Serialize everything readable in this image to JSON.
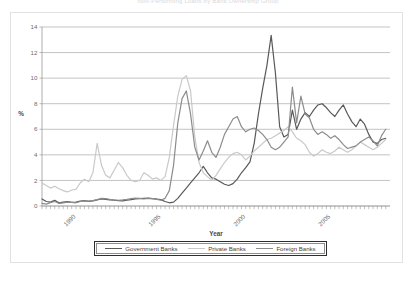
{
  "title": "Non-Performing Loans by Bank Ownership Group",
  "axis": {
    "ylabel": "%",
    "xlabel": "Year"
  },
  "legend": {
    "items": [
      {
        "label": "Government Banks",
        "color": "#595959"
      },
      {
        "label": "Private Banks",
        "color": "#c9c9c9"
      },
      {
        "label": "Foreign Banks",
        "color": "#8c8c8c"
      }
    ]
  },
  "chart_data": {
    "type": "line",
    "title": "Non-Performing Loans by Bank Ownership Group",
    "xlabel": "Year",
    "ylabel": "%",
    "xlim": [
      1988.0,
      2008.5
    ],
    "ylim": [
      0,
      14
    ],
    "yticks": [
      0,
      2,
      4,
      6,
      8,
      10,
      12,
      14
    ],
    "xticks": [
      1990,
      1995,
      2000,
      2005
    ],
    "xtick_labels": [
      "1990",
      "1995",
      "2000",
      "2005"
    ],
    "grid": "horizontal",
    "legend_position": "bottom",
    "x_tick_rotation": -45,
    "x": [
      1988.0,
      1988.25,
      1988.5,
      1988.75,
      1989.0,
      1989.25,
      1989.5,
      1989.75,
      1990.0,
      1990.25,
      1990.5,
      1990.75,
      1991.0,
      1991.25,
      1991.5,
      1991.75,
      1992.0,
      1992.25,
      1992.5,
      1992.75,
      1993.0,
      1993.25,
      1993.5,
      1993.75,
      1994.0,
      1994.25,
      1994.5,
      1994.75,
      1995.0,
      1995.25,
      1995.5,
      1995.75,
      1996.0,
      1996.25,
      1996.5,
      1996.75,
      1997.0,
      1997.25,
      1997.5,
      1997.75,
      1998.0,
      1998.25,
      1998.5,
      1998.75,
      1999.0,
      1999.25,
      1999.5,
      1999.75,
      2000.0,
      2000.25,
      2000.5,
      2000.75,
      2001.0,
      2001.25,
      2001.5,
      2001.75,
      2002.0,
      2002.25,
      2002.5,
      2002.75,
      2003.0,
      2003.25,
      2003.5,
      2003.75,
      2004.0,
      2004.25,
      2004.5,
      2004.75,
      2005.0,
      2005.25,
      2005.5,
      2005.75,
      2006.0,
      2006.25,
      2006.5,
      2006.75,
      2007.0,
      2007.25,
      2007.5,
      2007.75,
      2008.0,
      2008.25
    ],
    "series": [
      {
        "name": "Government Banks",
        "color": "#595959",
        "values": [
          0.55,
          0.35,
          0.3,
          0.45,
          0.25,
          0.3,
          0.35,
          0.28,
          0.3,
          0.38,
          0.42,
          0.36,
          0.4,
          0.48,
          0.55,
          0.52,
          0.48,
          0.45,
          0.42,
          0.4,
          0.45,
          0.5,
          0.55,
          0.58,
          0.6,
          0.62,
          0.58,
          0.55,
          0.5,
          0.35,
          0.25,
          0.3,
          0.6,
          1.0,
          1.4,
          1.8,
          2.2,
          2.6,
          3.1,
          2.6,
          2.2,
          2.1,
          1.9,
          1.7,
          1.6,
          1.75,
          2.1,
          2.6,
          3.0,
          3.45,
          4.9,
          7.2,
          9.2,
          11.0,
          13.35,
          10.4,
          6.2,
          5.4,
          5.6,
          7.5,
          6.0,
          6.8,
          7.3,
          7.0,
          7.5,
          7.9,
          8.0,
          7.7,
          7.3,
          7.0,
          7.5,
          7.9,
          7.2,
          6.6,
          6.2,
          6.8,
          6.4,
          5.6,
          5.0,
          4.9,
          5.2,
          5.3
        ]
      },
      {
        "name": "Private Banks",
        "color": "#c9c9c9",
        "values": [
          1.8,
          1.6,
          1.4,
          1.55,
          1.35,
          1.2,
          1.1,
          1.25,
          1.3,
          1.8,
          2.1,
          1.9,
          2.6,
          4.9,
          3.2,
          2.4,
          2.2,
          2.8,
          3.4,
          3.0,
          2.4,
          2.0,
          1.9,
          2.0,
          2.6,
          2.4,
          2.1,
          2.2,
          2.0,
          2.3,
          3.8,
          6.3,
          8.6,
          9.9,
          10.2,
          9.0,
          5.4,
          3.4,
          2.6,
          2.3,
          2.0,
          2.4,
          2.9,
          3.4,
          3.8,
          4.1,
          4.2,
          4.0,
          3.6,
          3.9,
          4.3,
          4.6,
          4.9,
          5.2,
          5.3,
          5.5,
          5.7,
          5.9,
          6.2,
          5.8,
          5.3,
          5.1,
          4.8,
          4.2,
          3.9,
          4.1,
          4.4,
          4.2,
          4.1,
          4.3,
          4.6,
          4.4,
          4.2,
          4.4,
          4.7,
          5.0,
          4.8,
          4.6,
          4.4,
          4.6,
          4.9,
          5.2
        ]
      },
      {
        "name": "Foreign Banks",
        "color": "#8c8c8c",
        "values": [
          0.2,
          0.15,
          0.25,
          0.35,
          0.2,
          0.25,
          0.3,
          0.28,
          0.25,
          0.35,
          0.4,
          0.38,
          0.42,
          0.5,
          0.6,
          0.58,
          0.52,
          0.48,
          0.45,
          0.48,
          0.52,
          0.58,
          0.62,
          0.6,
          0.55,
          0.6,
          0.58,
          0.52,
          0.45,
          0.6,
          1.2,
          3.2,
          6.5,
          8.4,
          9.0,
          7.2,
          4.6,
          3.6,
          4.3,
          5.1,
          4.2,
          3.8,
          4.6,
          5.6,
          6.2,
          6.8,
          7.0,
          6.2,
          5.8,
          6.0,
          6.1,
          5.9,
          5.6,
          5.2,
          4.6,
          4.4,
          4.6,
          5.0,
          5.4,
          9.3,
          6.5,
          8.6,
          7.2,
          6.9,
          6.0,
          5.6,
          5.8,
          5.6,
          5.3,
          5.5,
          5.2,
          4.8,
          4.5,
          4.6,
          4.7,
          5.0,
          5.2,
          5.4,
          5.1,
          4.7,
          5.5,
          6.0
        ]
      }
    ]
  }
}
